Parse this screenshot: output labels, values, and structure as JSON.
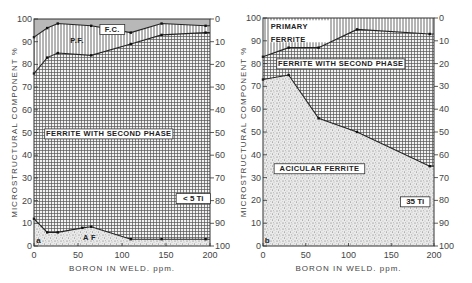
{
  "figure": {
    "panels": [
      {
        "id": "a",
        "panel_letter": "a",
        "condition_label": "< 5 Ti",
        "y_axis_label": "MICROSTRUCTURAL COMPONENT  %",
        "x_axis_label": "BORON   IN  WELD. ppm.",
        "region_labels": {
          "ferrite_carbide": "F.C.",
          "primary_ferrite": "P.F.",
          "ferrite_second_phase": "FERRITE  WITH SECOND PHASE",
          "acicular_ferrite": "A F"
        }
      },
      {
        "id": "b",
        "panel_letter": "b",
        "condition_label": "35 Ti",
        "y_axis_label": "MICROSTRUCTURAL COMPONENT  %",
        "x_axis_label": "BORON   IN  WELD. ppm.",
        "region_labels": {
          "primary_ferrite_line1": "PRIMARY",
          "primary_ferrite_line2": "FERRITE",
          "ferrite_second_phase": "FERRITE  WITH SECOND PHASE",
          "acicular_ferrite": "ACICULAR   FERRITE"
        }
      }
    ],
    "x_ticks": [
      "0",
      "50",
      "100",
      "150",
      "200"
    ],
    "y_ticks_left": [
      "0",
      "10",
      "20",
      "30",
      "40",
      "50",
      "60",
      "70",
      "80",
      "90",
      "100"
    ],
    "y_ticks_right": [
      "100",
      "90",
      "80",
      "70",
      "60",
      "50",
      "40",
      "30",
      "20",
      "10",
      "0"
    ]
  },
  "chart_data": [
    {
      "type": "area",
      "title": "(a) < 5 Ti",
      "xlabel": "BORON IN WELD. ppm.",
      "ylabel": "MICROSTRUCTURAL COMPONENT %",
      "xlim": [
        0,
        200
      ],
      "ylim": [
        0,
        100
      ],
      "secondary_ylim": [
        100,
        0
      ],
      "stacked_boundaries_cumulative_percent": true,
      "series": [
        {
          "name": "Acicular ferrite (A.F.) upper boundary",
          "x": [
            0,
            15,
            27,
            55,
            65,
            110,
            145,
            195
          ],
          "values": [
            12,
            6,
            6,
            8,
            8.5,
            3,
            3,
            3
          ]
        },
        {
          "name": "Ferrite with second phase upper boundary",
          "x": [
            0,
            15,
            27,
            65,
            110,
            145,
            195
          ],
          "values": [
            76,
            83,
            85,
            84,
            89,
            93,
            94
          ]
        },
        {
          "name": "Primary ferrite (P.F.) upper boundary",
          "x": [
            0,
            15,
            27,
            65,
            110,
            145,
            195
          ],
          "values": [
            92,
            96,
            98,
            97,
            94,
            98,
            97
          ]
        },
        {
          "name": "Ferrite carbide (F.C.) upper boundary",
          "x": [
            0,
            200
          ],
          "values": [
            100,
            100
          ]
        }
      ],
      "annotations": [
        "F.C.",
        "P.F.",
        "FERRITE WITH SECOND PHASE",
        "A F",
        "< 5 Ti",
        "a"
      ]
    },
    {
      "type": "area",
      "title": "(b) 35 Ti",
      "xlabel": "BORON IN WELD. ppm.",
      "ylabel": "MICROSTRUCTURAL COMPONENT %",
      "xlim": [
        0,
        200
      ],
      "ylim": [
        0,
        100
      ],
      "secondary_ylim": [
        100,
        0
      ],
      "stacked_boundaries_cumulative_percent": true,
      "series": [
        {
          "name": "Acicular ferrite upper boundary",
          "x": [
            0,
            30,
            65,
            110,
            195
          ],
          "values": [
            73,
            75,
            56,
            50,
            35
          ]
        },
        {
          "name": "Ferrite with second phase upper boundary",
          "x": [
            0,
            30,
            65,
            110,
            195
          ],
          "values": [
            83,
            87,
            87,
            95,
            93
          ]
        },
        {
          "name": "Primary ferrite upper boundary",
          "x": [
            0,
            200
          ],
          "values": [
            100,
            100
          ]
        }
      ],
      "annotations": [
        "PRIMARY FERRITE",
        "FERRITE WITH SECOND PHASE",
        "ACICULAR FERRITE",
        "35 Ti",
        "b"
      ]
    }
  ],
  "layout": {
    "panels_px": [
      {
        "x0": 34,
        "x1": 210,
        "y_top": 19,
        "y_bottom": 246
      },
      {
        "x0": 263,
        "x1": 434,
        "y_top": 18,
        "y_bottom": 246
      }
    ],
    "colors": {
      "frame": "#333333",
      "fc_fill": "#b8b8b8",
      "grid_pattern": "#555555",
      "vertical_pattern": "#444444",
      "stipple": "#6a6a6a",
      "background": "#ffffff"
    }
  }
}
